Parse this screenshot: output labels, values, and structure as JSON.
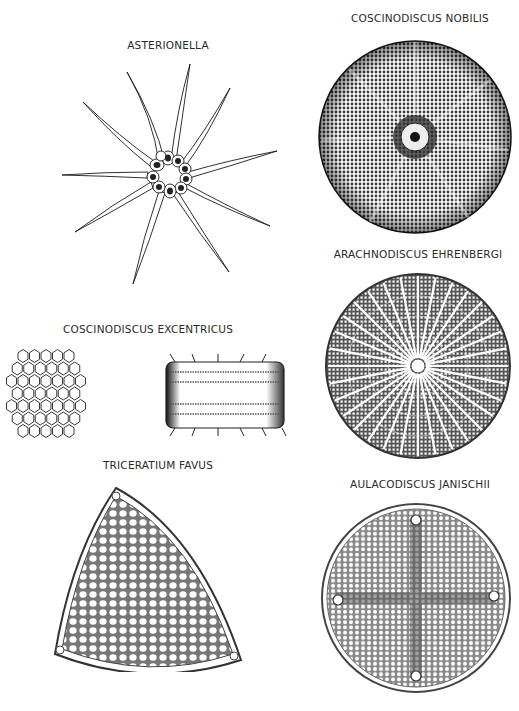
{
  "plate": {
    "specimens": [
      {
        "id": "asterionella",
        "label": "ASTERIONELLA"
      },
      {
        "id": "coscinodiscus-nobilis",
        "label": "COSCINODISCUS NOBILIS"
      },
      {
        "id": "arachnodiscus-ehrenbergi",
        "label": "ARACHNODISCUS EHRENBERGI"
      },
      {
        "id": "coscinodiscus-excentricus",
        "label": "COSCINODISCUS EXCENTRICUS"
      },
      {
        "id": "triceratium-favus",
        "label": "TRICERATIUM FAVUS"
      },
      {
        "id": "aulacodiscus-janischii",
        "label": "AULACODISCUS JANISCHII"
      }
    ]
  },
  "colors": {
    "ink": "#1a1a1a",
    "paper": "#ffffff",
    "label": "#2a2a2a"
  }
}
